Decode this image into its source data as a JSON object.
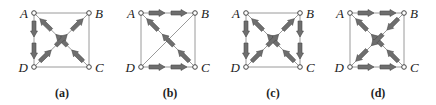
{
  "figure": {
    "panels": [
      {
        "id": "a",
        "caption": "(a)",
        "caption_x": 62,
        "nodes": {
          "A": [
            34,
            13
          ],
          "B": [
            89,
            13
          ],
          "C": [
            89,
            67
          ],
          "D": [
            34,
            67
          ]
        },
        "edges": [
          [
            "A",
            "B"
          ],
          [
            "B",
            "C"
          ],
          [
            "D",
            "C"
          ],
          [
            "A",
            "D"
          ],
          [
            "A",
            "C"
          ],
          [
            "B",
            "D"
          ]
        ],
        "arrows": [
          {
            "from": "A",
            "to": "D",
            "count": 2
          },
          {
            "from": "C",
            "to": "A",
            "count": 3
          },
          {
            "from": "D",
            "to": "B",
            "count": 3
          }
        ]
      },
      {
        "id": "b",
        "caption": "(b)",
        "caption_x": 170,
        "nodes": {
          "A": [
            141,
            13
          ],
          "B": [
            195,
            13
          ],
          "C": [
            195,
            67
          ],
          "D": [
            141,
            67
          ]
        },
        "edges": [
          [
            "A",
            "B"
          ],
          [
            "B",
            "C"
          ],
          [
            "D",
            "C"
          ],
          [
            "A",
            "D"
          ],
          [
            "A",
            "C"
          ],
          [
            "B",
            "D"
          ]
        ],
        "arrows": [
          {
            "from": "A",
            "to": "B",
            "count": 2
          },
          {
            "from": "D",
            "to": "C",
            "count": 2
          },
          {
            "from": "C",
            "to": "A",
            "count": 3
          }
        ]
      },
      {
        "id": "c",
        "caption": "(c)",
        "caption_x": 273,
        "nodes": {
          "A": [
            246,
            13
          ],
          "B": [
            300,
            13
          ],
          "C": [
            300,
            67
          ],
          "D": [
            246,
            67
          ]
        },
        "edges": [
          [
            "A",
            "B"
          ],
          [
            "B",
            "C"
          ],
          [
            "D",
            "C"
          ],
          [
            "A",
            "D"
          ],
          [
            "A",
            "C"
          ],
          [
            "B",
            "D"
          ]
        ],
        "arrows": [
          {
            "from": "A",
            "to": "D",
            "count": 2
          },
          {
            "from": "B",
            "to": "C",
            "count": 2
          },
          {
            "from": "C",
            "to": "A",
            "count": 3
          },
          {
            "from": "D",
            "to": "B",
            "count": 3
          }
        ]
      },
      {
        "id": "d",
        "caption": "(d)",
        "caption_x": 378,
        "nodes": {
          "A": [
            350,
            13
          ],
          "B": [
            404,
            13
          ],
          "C": [
            404,
            67
          ],
          "D": [
            350,
            67
          ]
        },
        "edges": [
          [
            "A",
            "B"
          ],
          [
            "B",
            "C"
          ],
          [
            "D",
            "C"
          ],
          [
            "A",
            "D"
          ],
          [
            "A",
            "C"
          ],
          [
            "B",
            "D"
          ]
        ],
        "arrows": [
          {
            "from": "A",
            "to": "B",
            "count": 2
          },
          {
            "from": "D",
            "to": "C",
            "count": 2
          },
          {
            "from": "C",
            "to": "A",
            "count": 3
          },
          {
            "from": "B",
            "to": "D",
            "count": 3
          }
        ]
      }
    ],
    "node_labels": {
      "A": "A",
      "B": "B",
      "C": "C",
      "D": "D"
    },
    "colors": {
      "edge": "#9a9a9a",
      "arrow": "#6e6e6e",
      "arrow_outline": "#4a4a4a",
      "node": "#ffffff",
      "node_stroke": "#444444",
      "text": "#222222"
    }
  }
}
